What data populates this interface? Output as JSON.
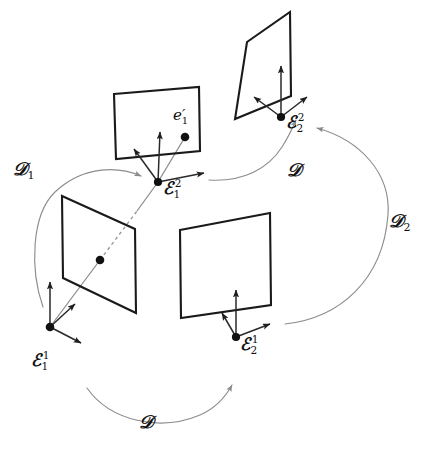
{
  "figure": {
    "kind": "geometry-diagram",
    "width": 427,
    "height": 452,
    "background": "#ffffff",
    "stroke_plane": "#1a1a1a",
    "stroke_axis": "#2a2a2a",
    "stroke_ray": "#8a8a8a",
    "stroke_curve": "#8d8d8d"
  },
  "frames": [
    {
      "id": "E-1-2",
      "base": "ℰ",
      "sub": "1",
      "sup": "2",
      "label": "ℰ1²",
      "origin": [
        158,
        182
      ],
      "label_pos": [
        163,
        186
      ],
      "plane": "top-middle"
    },
    {
      "id": "E-2-2",
      "base": "ℰ",
      "sub": "2",
      "sup": "2",
      "label": "ℰ2²",
      "origin": [
        281,
        117
      ],
      "label_pos": [
        287,
        119
      ],
      "plane": "top-right"
    },
    {
      "id": "E-1-1",
      "base": "ℰ",
      "sub": "1",
      "sup": "1",
      "label": "ℰ1¹",
      "origin": [
        50,
        327
      ],
      "label_pos": [
        32,
        357
      ],
      "plane": "left"
    },
    {
      "id": "E-2-1",
      "base": "ℰ",
      "sub": "2",
      "sup": "1",
      "label": "ℰ2¹",
      "origin": [
        236,
        337
      ],
      "label_pos": [
        241,
        341
      ],
      "plane": "bottom-right"
    }
  ],
  "points": [
    {
      "id": "e-prime-1",
      "base": "e",
      "prime": "′",
      "sub": "1",
      "label": "e′1",
      "pos": [
        185,
        137
      ],
      "label_pos": [
        174,
        113
      ]
    },
    {
      "id": "scene-point-left-plane",
      "label": "",
      "pos": [
        100,
        260
      ]
    }
  ],
  "maps": [
    {
      "id": "D-1",
      "base": "𝒟",
      "sub": "1",
      "label": "𝒟₁",
      "label_pos": [
        14,
        164
      ],
      "from": "E-1-1",
      "to": "E-1-2"
    },
    {
      "id": "D-top",
      "base": "𝒟",
      "sub": "",
      "label": "𝒟",
      "label_pos": [
        288,
        165
      ],
      "from": "E-1-2",
      "to": "E-2-2"
    },
    {
      "id": "D-2",
      "base": "𝒟",
      "sub": "2",
      "label": "𝒟₂",
      "label_pos": [
        390,
        216
      ],
      "from": "E-2-1",
      "to": "E-2-2"
    },
    {
      "id": "D-bottom",
      "base": "𝒟",
      "sub": "",
      "label": "𝒟",
      "label_pos": [
        140,
        417
      ],
      "from": "E-1-1",
      "to": "E-2-1"
    }
  ],
  "planes": [
    {
      "id": "top-middle",
      "corners": [
        [
          114,
          94
        ],
        [
          199,
          87
        ],
        [
          200,
          151
        ],
        [
          116,
          159
        ]
      ]
    },
    {
      "id": "top-right",
      "corners": [
        [
          247,
          42
        ],
        [
          290,
          12
        ],
        [
          291,
          96
        ],
        [
          235,
          119
        ]
      ]
    },
    {
      "id": "left",
      "corners": [
        [
          62,
          196
        ],
        [
          135,
          229
        ],
        [
          136,
          313
        ],
        [
          63,
          278
        ]
      ]
    },
    {
      "id": "bottom-right",
      "corners": [
        [
          180,
          230
        ],
        [
          270,
          213
        ],
        [
          271,
          305
        ],
        [
          181,
          318
        ]
      ]
    }
  ]
}
